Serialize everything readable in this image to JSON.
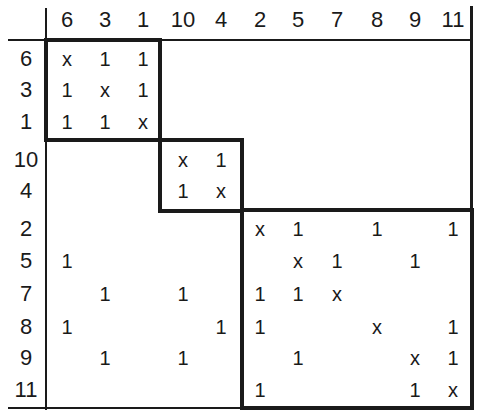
{
  "matrix": {
    "column_labels": [
      "6",
      "3",
      "1",
      "10",
      "4",
      "2",
      "5",
      "7",
      "8",
      "9",
      "11"
    ],
    "row_labels": [
      "6",
      "3",
      "1",
      "10",
      "4",
      "2",
      "5",
      "7",
      "8",
      "9",
      "11"
    ],
    "rows": [
      [
        "x",
        "1",
        "1",
        "",
        "",
        "",
        "",
        "",
        "",
        "",
        ""
      ],
      [
        "1",
        "x",
        "1",
        "",
        "",
        "",
        "",
        "",
        "",
        "",
        ""
      ],
      [
        "1",
        "1",
        "x",
        "",
        "",
        "",
        "",
        "",
        "",
        "",
        ""
      ],
      [
        "",
        "",
        "",
        "x",
        "1",
        "",
        "",
        "",
        "",
        "",
        ""
      ],
      [
        "",
        "",
        "",
        "1",
        "x",
        "",
        "",
        "",
        "",
        "",
        ""
      ],
      [
        "",
        "",
        "",
        "",
        "",
        "x",
        "1",
        "",
        "1",
        "",
        "1"
      ],
      [
        "1",
        "",
        "",
        "",
        "",
        "",
        "x",
        "1",
        "",
        "1",
        ""
      ],
      [
        "",
        "1",
        "",
        "1",
        "",
        "1",
        "1",
        "x",
        "",
        "",
        ""
      ],
      [
        "1",
        "",
        "",
        "",
        "1",
        "1",
        "",
        "",
        "x",
        "",
        "1"
      ],
      [
        "",
        "1",
        "",
        "1",
        "",
        "",
        "1",
        "",
        "",
        "x",
        "1"
      ],
      [
        "",
        "",
        "",
        "",
        "",
        "1",
        "",
        "",
        "",
        "1",
        "x"
      ]
    ],
    "blocks": [
      {
        "name": "block-1",
        "members": [
          "6",
          "3",
          "1"
        ]
      },
      {
        "name": "block-2",
        "members": [
          "10",
          "4"
        ]
      },
      {
        "name": "block-3",
        "members": [
          "2",
          "5",
          "7",
          "8",
          "9",
          "11"
        ]
      }
    ]
  }
}
